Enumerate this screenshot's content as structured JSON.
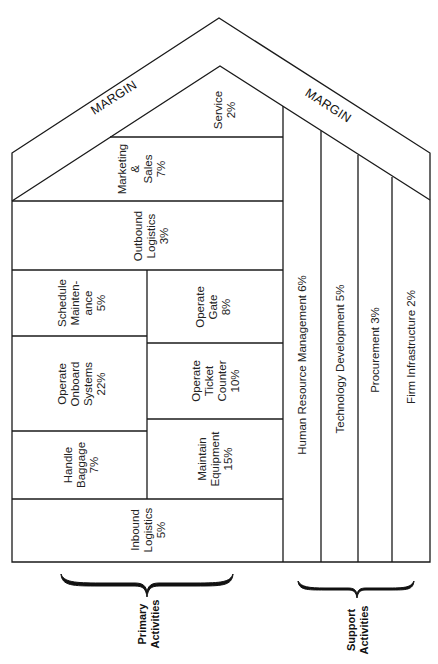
{
  "diagram": {
    "type": "value-chain",
    "margin_left": "MARGIN",
    "margin_right": "MARGIN",
    "primary": {
      "service": {
        "lines": [
          "Service",
          "2%"
        ]
      },
      "marketing_sales": {
        "lines": [
          "Marketing",
          "&",
          "Sales",
          "7%"
        ]
      },
      "outbound_logistics": {
        "lines": [
          "Outbound",
          "Logistics",
          "3%"
        ]
      },
      "schedule_maintenance": {
        "lines": [
          "Schedule",
          "Mainten-",
          "ance",
          "5%"
        ]
      },
      "operate_gate": {
        "lines": [
          "Operate",
          "Gate",
          "8%"
        ]
      },
      "operate_onboard_systems": {
        "lines": [
          "Operate",
          "Onboard",
          "Systems",
          "22%"
        ]
      },
      "operate_ticket_counter": {
        "lines": [
          "Operate",
          "Ticket",
          "Counter",
          "10%"
        ]
      },
      "handle_baggage": {
        "lines": [
          "Handle",
          "Baggage",
          "7%"
        ]
      },
      "maintain_equipment": {
        "lines": [
          "Maintain",
          "Equipment",
          "15%"
        ]
      },
      "inbound_logistics": {
        "lines": [
          "Inbound",
          "Logistics",
          "5%"
        ]
      }
    },
    "support": {
      "human_resource": "Human Resource Management 6%",
      "technology": "Technology Development 5%",
      "procurement": "Procurement 3%",
      "firm_infrastructure": "Firm Infrastructure 2%"
    },
    "brace_labels": {
      "primary": [
        "Primary",
        "Activities"
      ],
      "support": [
        "Support",
        "Activities"
      ]
    }
  }
}
